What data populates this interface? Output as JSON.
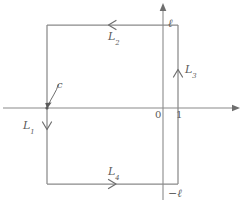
{
  "figure": {
    "type": "complex-plane-rectangular-contour",
    "stroke_color": "#7a7a7a",
    "text_color": "#5b5b5b",
    "background": "#ffffff",
    "width": 251,
    "height": 206
  },
  "axes": {
    "horizontal": {
      "name": "real-axis",
      "y": 108,
      "x_start": 3,
      "x_end": 240,
      "arrow": "right"
    },
    "vertical": {
      "name": "imaginary-axis",
      "x": 163,
      "y_start": 3,
      "y_end": 200,
      "arrow": "up"
    }
  },
  "contour": {
    "name": "rectangular-contour",
    "left": 47,
    "right": 178,
    "top": 25,
    "bottom": 184
  },
  "labels": {
    "ell_top": "ℓ",
    "ell_bottom": "−ℓ",
    "zero": "0",
    "one": "1",
    "c": "c",
    "L1_base": "L",
    "L1_sub": "1",
    "L2_base": "L",
    "L2_sub": "2",
    "L3_base": "L",
    "L3_sub": "3",
    "L4_base": "L",
    "L4_sub": "4"
  },
  "segments": [
    {
      "id": "L1",
      "label": "L1",
      "edge": "left",
      "direction": "down"
    },
    {
      "id": "L2",
      "label": "L2",
      "edge": "top",
      "direction": "left"
    },
    {
      "id": "L3",
      "label": "L3",
      "edge": "right",
      "direction": "up"
    },
    {
      "id": "L4",
      "label": "L4",
      "edge": "bottom",
      "direction": "right"
    }
  ]
}
